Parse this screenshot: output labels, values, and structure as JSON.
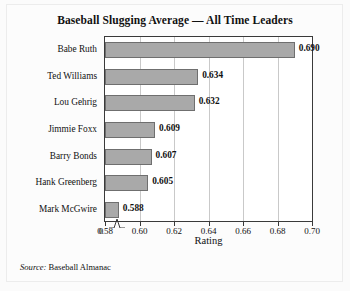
{
  "chart_data": {
    "type": "bar",
    "orientation": "horizontal",
    "title": "Baseball Slugging Average — All Time Leaders",
    "xlabel": "Rating",
    "ylabel": "",
    "categories": [
      "Babe Ruth",
      "Ted Williams",
      "Lou Gehrig",
      "Jimmie Foxx",
      "Barry Bonds",
      "Hank Greenberg",
      "Mark McGwire"
    ],
    "values": [
      0.69,
      0.634,
      0.632,
      0.609,
      0.607,
      0.605,
      0.588
    ],
    "value_labels": [
      "0.690",
      "0.634",
      "0.632",
      "0.609",
      "0.607",
      "0.605",
      "0.588"
    ],
    "xlim": [
      0.58,
      0.7
    ],
    "xticks": [
      0.58,
      0.6,
      0.62,
      0.64,
      0.66,
      0.68,
      0.7
    ],
    "xtick_labels": [
      "0.58",
      "0.60",
      "0.62",
      "0.64",
      "0.66",
      "0.68",
      "0.70"
    ],
    "origin_tick_label": "0",
    "axis_break": true,
    "grid": "vertical",
    "legend": "none",
    "bar_color": "#a9a9a9",
    "bar_edge_color": "#6f6f6f",
    "axis_color": "#3a3a3a",
    "gridline_color": "#c9c9c9"
  },
  "source": {
    "keyword": "Source:",
    "text": "Baseball Almanac"
  }
}
